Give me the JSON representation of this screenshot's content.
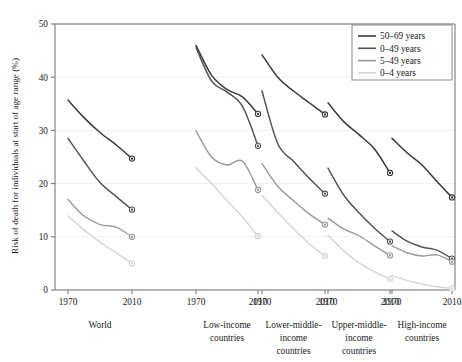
{
  "chart_data": {
    "type": "line",
    "title": "",
    "xlabel": "",
    "ylabel": "Risk of death for individuals at start of age range (%)",
    "ylim": [
      0,
      50
    ],
    "yticks": [
      0,
      10,
      20,
      30,
      40,
      50
    ],
    "ytick_labels": [
      "0",
      "10",
      "20",
      "30",
      "40",
      "50"
    ],
    "xticks": [
      1970,
      2010
    ],
    "xtick_labels": [
      "1970",
      "2010"
    ],
    "grid": "horizontal-light",
    "legend_position": "top-right",
    "legend": [
      {
        "label": "50–69 years",
        "color": "#3a3a3a"
      },
      {
        "label": "0–49 years",
        "color": "#555555"
      },
      {
        "label": "5–49 years",
        "color": "#9a9a9a"
      },
      {
        "label": "0–4 years",
        "color": "#d5d5d5"
      }
    ],
    "panels": [
      {
        "name": "World",
        "label_lines": [
          "World"
        ],
        "x": [
          1970,
          1980,
          1990,
          2000,
          2010
        ],
        "series": [
          {
            "name": "50–69 years",
            "color": "#3a3a3a",
            "values": [
              35.7,
              32.4,
              29.6,
              27.3,
              24.7
            ],
            "end_marker": true,
            "end_value": 24.7
          },
          {
            "name": "0–49 years",
            "color": "#555555",
            "values": [
              28.5,
              24.2,
              20.2,
              17.6,
              15.1
            ],
            "end_marker": true,
            "end_value": 15.1
          },
          {
            "name": "5–49 years",
            "color": "#9a9a9a",
            "values": [
              17.0,
              13.9,
              12.3,
              11.8,
              10.0
            ],
            "end_marker": true,
            "end_value": 10.0
          },
          {
            "name": "0–4 years",
            "color": "#d5d5d5",
            "values": [
              13.9,
              11.3,
              9.0,
              7.0,
              5.0
            ],
            "end_marker": true,
            "end_value": 5.0
          }
        ]
      },
      {
        "name": "Low-income countries",
        "label_lines": [
          "Low-income",
          "countries"
        ],
        "x": [
          1970,
          1980,
          1990,
          2000,
          2010
        ],
        "series": [
          {
            "name": "50–69 years",
            "color": "#3a3a3a",
            "values": [
              46.0,
              40.4,
              37.7,
              36.3,
              33.1
            ],
            "end_marker": true,
            "end_value": 33.1
          },
          {
            "name": "0–49 years",
            "color": "#555555",
            "values": [
              45.6,
              39.3,
              37.2,
              34.5,
              27.1
            ],
            "end_marker": true,
            "end_value": 27.1
          },
          {
            "name": "5–49 years",
            "color": "#9a9a9a",
            "values": [
              29.9,
              25.0,
              23.5,
              24.2,
              18.8
            ],
            "end_marker": true,
            "end_value": 18.8
          },
          {
            "name": "0–4 years",
            "color": "#d5d5d5",
            "values": [
              23.0,
              20.0,
              16.8,
              13.7,
              10.1
            ],
            "end_marker": true,
            "end_value": 10.1
          }
        ]
      },
      {
        "name": "Lower-middle-income countries",
        "label_lines": [
          "Lower-middle-",
          "income",
          "countries"
        ],
        "x": [
          1970,
          1980,
          1990,
          2000,
          2010
        ],
        "series": [
          {
            "name": "50–69 years",
            "color": "#3a3a3a",
            "values": [
              44.2,
              40.0,
              37.4,
              35.2,
              33.0
            ],
            "end_marker": true,
            "end_value": 33.0
          },
          {
            "name": "0–49 years",
            "color": "#555555",
            "values": [
              37.4,
              27.5,
              24.2,
              21.0,
              18.1
            ],
            "end_marker": true,
            "end_value": 18.1
          },
          {
            "name": "5–49 years",
            "color": "#9a9a9a",
            "values": [
              23.8,
              19.5,
              16.8,
              14.3,
              12.3
            ],
            "end_marker": true,
            "end_value": 12.3
          },
          {
            "name": "0–4 years",
            "color": "#d5d5d5",
            "values": [
              17.8,
              14.6,
              11.5,
              8.7,
              6.4
            ],
            "end_marker": true,
            "end_value": 6.4
          }
        ]
      },
      {
        "name": "Upper-middle-income countries",
        "label_lines": [
          "Upper-middle-",
          "income",
          "countries"
        ],
        "x": [
          1970,
          1980,
          1990,
          2000,
          2010
        ],
        "series": [
          {
            "name": "50–69 years",
            "color": "#3a3a3a",
            "values": [
              35.2,
              31.7,
              29.2,
              26.5,
              22.0
            ],
            "end_marker": true,
            "end_value": 22.0
          },
          {
            "name": "0–49 years",
            "color": "#555555",
            "values": [
              22.9,
              17.9,
              14.5,
              11.6,
              9.1
            ],
            "end_marker": true,
            "end_value": 9.1
          },
          {
            "name": "5–49 years",
            "color": "#9a9a9a",
            "values": [
              13.5,
              11.5,
              10.2,
              8.3,
              6.5
            ],
            "end_marker": true,
            "end_value": 6.5
          },
          {
            "name": "0–4 years",
            "color": "#d5d5d5",
            "values": [
              10.3,
              7.4,
              5.1,
              3.4,
              2.1
            ],
            "end_marker": true,
            "end_value": 2.1
          }
        ]
      },
      {
        "name": "High-income countries",
        "label_lines": [
          "High-income",
          "countries"
        ],
        "x": [
          1970,
          1980,
          1990,
          2000,
          2010
        ],
        "series": [
          {
            "name": "50–69 years",
            "color": "#3a3a3a",
            "values": [
              28.5,
              25.8,
              23.5,
              20.4,
              17.4
            ],
            "end_marker": true,
            "end_value": 17.4
          },
          {
            "name": "0–49 years",
            "color": "#555555",
            "values": [
              11.1,
              9.2,
              8.1,
              7.5,
              5.9
            ],
            "end_marker": true,
            "end_value": 5.9
          },
          {
            "name": "5–49 years",
            "color": "#9a9a9a",
            "values": [
              8.3,
              7.0,
              6.4,
              6.6,
              5.3
            ],
            "end_marker": true,
            "end_value": 5.3
          },
          {
            "name": "0–4 years",
            "color": "#d5d5d5",
            "values": [
              2.7,
              1.8,
              1.1,
              0.6,
              0.3
            ],
            "end_marker": true,
            "end_value": 0.3
          }
        ]
      }
    ]
  }
}
